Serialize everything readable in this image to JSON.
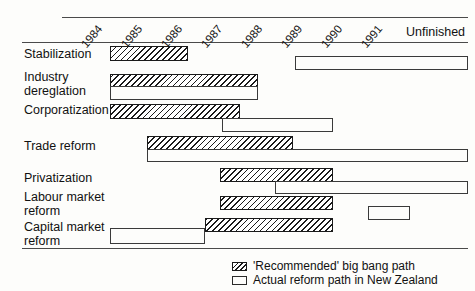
{
  "chart_data": {
    "type": "bar",
    "title": "",
    "subtitle": "",
    "xlabel": "",
    "ylabel": "",
    "orientation": "horizontal-timeline",
    "grid": false,
    "axis_years": [
      "1984",
      "1985",
      "1986",
      "1987",
      "1988",
      "1989",
      "1990",
      "1991"
    ],
    "axis_extra_tick": "Unfinished",
    "xlim": [
      "1984",
      "Unfinished"
    ],
    "legend_position": "bottom-right",
    "legend": [
      {
        "key": "recommended",
        "label": "'Recommended' big bang path",
        "style": "hatched"
      },
      {
        "key": "actual",
        "label": "Actual reform path in New Zealand",
        "style": "open-outline"
      }
    ],
    "categories": [
      "Stabilization",
      "Industry deregulation",
      "Corporatization",
      "Trade reform",
      "Privatization",
      "Labour market reform",
      "Capital market reform"
    ],
    "series": [
      {
        "name": "'Recommended' big bang path",
        "style": "hatched",
        "bars": [
          {
            "category": "Stabilization",
            "start": "1984.0",
            "end": "1985.4"
          },
          {
            "category": "Industry deregulation",
            "start": "1984.0",
            "end": "1986.8"
          },
          {
            "category": "Corporatization",
            "start": "1984.0",
            "end": "1986.5"
          },
          {
            "category": "Trade reform",
            "start": "1984.7",
            "end": "1987.5"
          },
          {
            "category": "Privatization",
            "start": "1986.1",
            "end": "1988.3"
          },
          {
            "category": "Labour market reform",
            "start": "1986.1",
            "end": "1988.3"
          },
          {
            "category": "Capital market reform",
            "start": "1985.8",
            "end": "1988.3"
          }
        ]
      },
      {
        "name": "Actual reform path in New Zealand",
        "style": "open-outline",
        "bars": [
          {
            "category": "Stabilization",
            "start": "1987.3",
            "end": "Unfinished"
          },
          {
            "category": "Industry deregulation",
            "start": "1984.0",
            "end": "1986.8"
          },
          {
            "category": "Corporatization",
            "start": "1986.2",
            "end": "1988.3"
          },
          {
            "category": "Trade reform",
            "start": "1984.7",
            "end": "Unfinished"
          },
          {
            "category": "Privatization",
            "start": "1987.2",
            "end": "Unfinished"
          },
          {
            "category": "Labour market reform",
            "start": "1988.9",
            "end": "1989.7"
          },
          {
            "category": "Capital market reform",
            "start": "1984.0",
            "end": "1985.8"
          }
        ]
      }
    ]
  },
  "axis": {
    "ticks": [
      {
        "label": "1984",
        "x": 88,
        "y": 38
      },
      {
        "label": "1985",
        "x": 128,
        "y": 38
      },
      {
        "label": "1986",
        "x": 168,
        "y": 38
      },
      {
        "label": "1987",
        "x": 208,
        "y": 38
      },
      {
        "label": "1988",
        "x": 248,
        "y": 38
      },
      {
        "label": "1989",
        "x": 288,
        "y": 38
      },
      {
        "label": "1990",
        "x": 328,
        "y": 38
      },
      {
        "label": "1991",
        "x": 368,
        "y": 38
      }
    ],
    "unfinished": "Unfinished"
  },
  "rows": [
    {
      "key": "stabilization",
      "label": "Stabilization",
      "label_top": 48,
      "label_left": 24
    },
    {
      "key": "industry-deregulation",
      "label": "Industry\ndereglation",
      "label_top": 71,
      "label_left": 24
    },
    {
      "key": "corporatization",
      "label": "Corporatization",
      "label_top": 104,
      "label_left": 24
    },
    {
      "key": "trade-reform",
      "label": "Trade reform",
      "label_top": 140,
      "label_left": 24
    },
    {
      "key": "privatization",
      "label": "Privatization",
      "label_top": 172,
      "label_left": 24
    },
    {
      "key": "labour-market-reform",
      "label": "Labour market\nreform",
      "label_top": 191,
      "label_left": 24
    },
    {
      "key": "capital-market-reform",
      "label": "Capital market\nreform",
      "label_top": 221,
      "label_left": 24
    }
  ],
  "bars": [
    {
      "row": "stabilization",
      "kind": "hatch",
      "x": 110,
      "y": 46,
      "w": 78,
      "h": 15
    },
    {
      "row": "stabilization",
      "kind": "open",
      "x": 295,
      "y": 56,
      "w": 173,
      "h": 14
    },
    {
      "row": "industry-deregulation",
      "kind": "hatch",
      "x": 110,
      "y": 74,
      "w": 148,
      "h": 13
    },
    {
      "row": "industry-deregulation",
      "kind": "open",
      "x": 110,
      "y": 86,
      "w": 148,
      "h": 14
    },
    {
      "row": "corporatization",
      "kind": "hatch",
      "x": 110,
      "y": 104,
      "w": 130,
      "h": 15
    },
    {
      "row": "corporatization",
      "kind": "open",
      "x": 222,
      "y": 118,
      "w": 111,
      "h": 14
    },
    {
      "row": "trade-reform",
      "kind": "hatch",
      "x": 147,
      "y": 136,
      "w": 146,
      "h": 14
    },
    {
      "row": "trade-reform",
      "kind": "open",
      "x": 147,
      "y": 149,
      "w": 321,
      "h": 13
    },
    {
      "row": "privatization",
      "kind": "hatch",
      "x": 220,
      "y": 168,
      "w": 113,
      "h": 14
    },
    {
      "row": "privatization",
      "kind": "open",
      "x": 275,
      "y": 181,
      "w": 193,
      "h": 13
    },
    {
      "row": "labour-market-reform",
      "kind": "hatch",
      "x": 220,
      "y": 196,
      "w": 113,
      "h": 14
    },
    {
      "row": "labour-market-reform",
      "kind": "open",
      "x": 368,
      "y": 206,
      "w": 42,
      "h": 14
    },
    {
      "row": "capital-market-reform",
      "kind": "hatch",
      "x": 205,
      "y": 218,
      "w": 128,
      "h": 14
    },
    {
      "row": "capital-market-reform",
      "kind": "open",
      "x": 110,
      "y": 228,
      "w": 95,
      "h": 16
    }
  ],
  "legend": {
    "recommended": "'Recommended' big bang path",
    "actual": "Actual reform path in New Zealand"
  }
}
